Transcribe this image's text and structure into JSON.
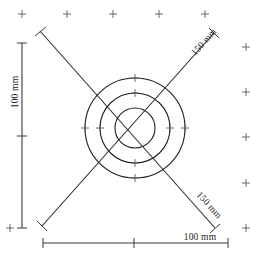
{
  "drawing": {
    "title": "Concentric circle target dimension drawing",
    "units": "mm",
    "background_color": "#ffffff",
    "line_color": "#2b2b2b",
    "mark_color": "#5a5a5a"
  },
  "dimensions": {
    "vertical": {
      "label": "100 mm",
      "value": 100,
      "orientation": "vertical",
      "position": "left"
    },
    "horizontal": {
      "label": "100 mm",
      "value": 100,
      "orientation": "horizontal",
      "position": "bottom"
    },
    "diagonal_upper_right": {
      "label": "150 mm",
      "value": 150,
      "orientation": "diagonal",
      "position": "upper-right"
    },
    "diagonal_lower_right": {
      "label": "150 mm",
      "value": 150,
      "orientation": "diagonal",
      "position": "lower-right"
    }
  },
  "geometry": {
    "center": {
      "x": 135,
      "y": 128
    },
    "circles": [
      {
        "name": "outer-circle",
        "radius": 50
      },
      {
        "name": "middle-circle",
        "radius": 35
      },
      {
        "name": "inner-circle",
        "radius": 20
      }
    ],
    "diagonals": [
      {
        "name": "diagonal-nwse",
        "x1": 40,
        "y1": 31,
        "x2": 215,
        "y2": 228
      },
      {
        "name": "diagonal-swne",
        "x1": 42,
        "y1": 226,
        "x2": 214,
        "y2": 33
      }
    ],
    "vertical_dim_line": {
      "x": 22,
      "y1": 43,
      "y2": 228,
      "mid_tick_y": 136
    },
    "horizontal_dim_line": {
      "y": 243,
      "x1": 43,
      "x2": 228,
      "mid_tick_x": 134
    },
    "circle_ticks": [
      {
        "name": "tick-outer-top",
        "x": 135,
        "y": 78
      },
      {
        "name": "tick-middle-top",
        "x": 135,
        "y": 93
      },
      {
        "name": "tick-outer-left",
        "x": 85,
        "y": 128
      },
      {
        "name": "tick-middle-left",
        "x": 100,
        "y": 128
      },
      {
        "name": "tick-outer-right",
        "x": 185,
        "y": 128
      },
      {
        "name": "tick-middle-right",
        "x": 170,
        "y": 128
      },
      {
        "name": "tick-outer-bottom",
        "x": 135,
        "y": 178
      },
      {
        "name": "tick-middle-bottom",
        "x": 135,
        "y": 163
      }
    ],
    "registration_marks": [
      {
        "name": "mark-top-1",
        "x": 22,
        "y": 14
      },
      {
        "name": "mark-top-2",
        "x": 67,
        "y": 14
      },
      {
        "name": "mark-top-3",
        "x": 113,
        "y": 14
      },
      {
        "name": "mark-top-4",
        "x": 159,
        "y": 14
      },
      {
        "name": "mark-top-5",
        "x": 205,
        "y": 14
      },
      {
        "name": "mark-right-1",
        "x": 246,
        "y": 47
      },
      {
        "name": "mark-right-2",
        "x": 246,
        "y": 92
      },
      {
        "name": "mark-right-3",
        "x": 246,
        "y": 137
      },
      {
        "name": "mark-right-4",
        "x": 246,
        "y": 183
      },
      {
        "name": "mark-right-5",
        "x": 246,
        "y": 228
      },
      {
        "name": "mark-left-1",
        "x": 10,
        "y": 228
      },
      {
        "name": "mark-left-2",
        "x": 10,
        "y": 14
      }
    ]
  }
}
